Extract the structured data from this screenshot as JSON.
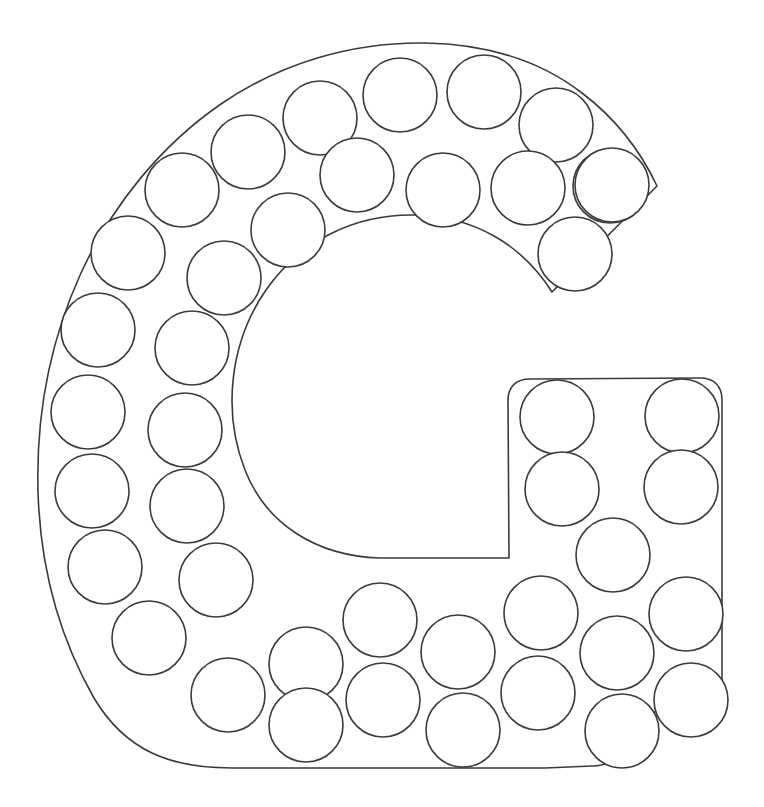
{
  "page": {
    "title": "Letter G Dot Marker Template",
    "background_color": "#ffffff",
    "width": 764,
    "height": 807
  },
  "artwork": {
    "type": "letter-outline-dot-template",
    "letter": "G",
    "case": "uppercase",
    "description": "Uppercase letter G outline filled with empty circles for dot markers",
    "stroke_color": "#3a3a3a",
    "fill_color": "#ffffff",
    "stroke_width": 1.6,
    "dot_count": 45,
    "dot_radius": 37,
    "letter_bounds": {
      "x": 36,
      "y": 42,
      "width": 686,
      "height": 726
    },
    "counter_center": {
      "x": 375,
      "y": 442
    },
    "counter_radius": 132
  },
  "letter_path": "M 657 186 C 640 150 615 118 582 93 C 538 59 483 44 425 43 C 352 42 281 63 221 104 C 160 146 112 206 81 273 C 50 341 36 416 38 491 C 40 563 58 635 94 698 C 126 752 172 768 232 768 L 545 768 L 592 766 C 608 766 617 760 618 745 L 619 712 L 700 712 C 714 712 722 704 722 690 L 722 400 C 722 386 714 378 700 378 L 530 379 C 516 379 508 387 508 400 L 509 558 L 380 558 C 316 556 266 524 245 470 C 222 411 230 342 266 290 C 300 241 355 214 414 215 C 472 216 521 243 552 292 Z",
  "dots": [
    {
      "cx": 320,
      "cy": 118,
      "r": 37
    },
    {
      "cx": 400,
      "cy": 95,
      "r": 37
    },
    {
      "cx": 484,
      "cy": 92,
      "r": 37
    },
    {
      "cx": 556,
      "cy": 125,
      "r": 37
    },
    {
      "cx": 610,
      "cy": 186,
      "r": 37
    },
    {
      "cx": 248,
      "cy": 152,
      "r": 37
    },
    {
      "cx": 357,
      "cy": 175,
      "r": 37
    },
    {
      "cx": 443,
      "cy": 190,
      "r": 37
    },
    {
      "cx": 528,
      "cy": 188,
      "r": 37
    },
    {
      "cx": 612,
      "cy": 185,
      "r": 37
    },
    {
      "cx": 182,
      "cy": 190,
      "r": 37
    },
    {
      "cx": 288,
      "cy": 230,
      "r": 37
    },
    {
      "cx": 575,
      "cy": 254,
      "r": 37
    },
    {
      "cx": 128,
      "cy": 253,
      "r": 37
    },
    {
      "cx": 224,
      "cy": 278,
      "r": 37
    },
    {
      "cx": 98,
      "cy": 330,
      "r": 37
    },
    {
      "cx": 192,
      "cy": 348,
      "r": 37
    },
    {
      "cx": 88,
      "cy": 412,
      "r": 37
    },
    {
      "cx": 185,
      "cy": 430,
      "r": 37
    },
    {
      "cx": 92,
      "cy": 491,
      "r": 37
    },
    {
      "cx": 187,
      "cy": 506,
      "r": 37
    },
    {
      "cx": 105,
      "cy": 567,
      "r": 37
    },
    {
      "cx": 216,
      "cy": 580,
      "r": 37
    },
    {
      "cx": 149,
      "cy": 638,
      "r": 37
    },
    {
      "cx": 228,
      "cy": 695,
      "r": 37
    },
    {
      "cx": 306,
      "cy": 664,
      "r": 37
    },
    {
      "cx": 306,
      "cy": 725,
      "r": 37
    },
    {
      "cx": 383,
      "cy": 700,
      "r": 37
    },
    {
      "cx": 380,
      "cy": 620,
      "r": 37
    },
    {
      "cx": 458,
      "cy": 652,
      "r": 37
    },
    {
      "cx": 463,
      "cy": 730,
      "r": 37
    },
    {
      "cx": 538,
      "cy": 693,
      "r": 37
    },
    {
      "cx": 541,
      "cy": 613,
      "r": 37
    },
    {
      "cx": 617,
      "cy": 653,
      "r": 37
    },
    {
      "cx": 622,
      "cy": 731,
      "r": 37
    },
    {
      "cx": 557,
      "cy": 417,
      "r": 37
    },
    {
      "cx": 682,
      "cy": 416,
      "r": 37
    },
    {
      "cx": 562,
      "cy": 489,
      "r": 37
    },
    {
      "cx": 681,
      "cy": 487,
      "r": 37
    },
    {
      "cx": 613,
      "cy": 555,
      "r": 37
    },
    {
      "cx": 686,
      "cy": 614,
      "r": 37
    },
    {
      "cx": 691,
      "cy": 700,
      "r": 37
    },
    {
      "cx": 1000,
      "cy": 1000,
      "r": 0
    },
    {
      "cx": 1000,
      "cy": 1000,
      "r": 0
    },
    {
      "cx": 1000,
      "cy": 1000,
      "r": 0
    }
  ]
}
